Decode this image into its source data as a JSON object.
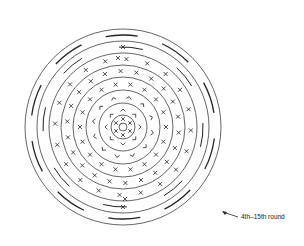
{
  "diagram": {
    "type": "crochet-round-chart",
    "center": [
      123,
      127
    ],
    "ring_radii": [
      98,
      86,
      74,
      62,
      50,
      37,
      24,
      12,
      4
    ],
    "stroke_color": "#222222",
    "symbols": {
      "single_crochet": "X",
      "chain_arc": "V-shape",
      "increase": "long-dash"
    }
  },
  "annotation": {
    "label": "4th–15th round",
    "arrow_icon": "arrow-up-left"
  }
}
